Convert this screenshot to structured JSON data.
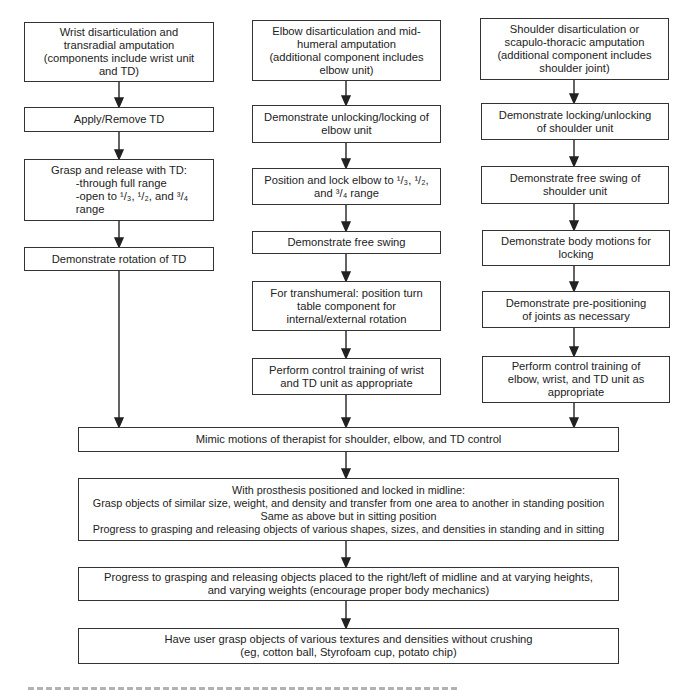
{
  "diagram": {
    "columns": {
      "left": {
        "header": [
          "Wrist disarticulation and",
          "transradial amputation",
          "(components include wrist unit",
          "and TD)"
        ],
        "steps": [
          [
            "Apply/Remove TD"
          ],
          [
            "Grasp and release with TD:",
            "-through full range",
            "-open to ¹/₃, ¹/₂, and ³/₄",
            "range"
          ],
          [
            "Demonstrate rotation of TD"
          ]
        ]
      },
      "middle": {
        "header": [
          "Elbow disarticulation and mid-",
          "humeral amputation",
          "(additional component includes",
          "elbow unit)"
        ],
        "steps": [
          [
            "Demonstrate unlocking/locking of",
            "elbow unit"
          ],
          [
            "Position and lock elbow to ¹/₃, ¹/₂,",
            "and ³/₄ range"
          ],
          [
            "Demonstrate free swing"
          ],
          [
            "For transhumeral: position turn",
            "table component for",
            "internal/external rotation"
          ],
          [
            "Perform control training of wrist",
            "and TD unit as appropriate"
          ]
        ]
      },
      "right": {
        "header": [
          "Shoulder disarticulation or",
          "scapulo-thoracic amputation",
          "(additional component includes",
          "shoulder joint)"
        ],
        "steps": [
          [
            "Demonstrate locking/unlocking",
            "of shoulder unit"
          ],
          [
            "Demonstrate free swing of",
            "shoulder unit"
          ],
          [
            "Demonstrate body motions for",
            "locking"
          ],
          [
            "Demonstrate pre-positioning",
            "of joints as necessary"
          ],
          [
            "Perform control training of",
            "elbow, wrist, and TD unit as",
            "appropriate"
          ]
        ]
      }
    },
    "merged": [
      [
        "Mimic motions of therapist for shoulder, elbow, and TD control"
      ],
      [
        "With prosthesis positioned and locked in midline:",
        "Grasp objects of similar size, weight, and density and transfer from one area to another in standing position",
        "Same as above but in sitting position",
        "Progress to grasping and releasing objects of various shapes, sizes, and densities in standing and in sitting"
      ],
      [
        "Progress to grasping and releasing objects placed to the right/left of midline and at varying heights,",
        "and varying weights (encourage proper body mechanics)"
      ],
      [
        "Have user grasp objects of various textures and densities without crushing",
        "(eg, cotton ball, Styrofoam cup, potato chip)"
      ]
    ]
  }
}
